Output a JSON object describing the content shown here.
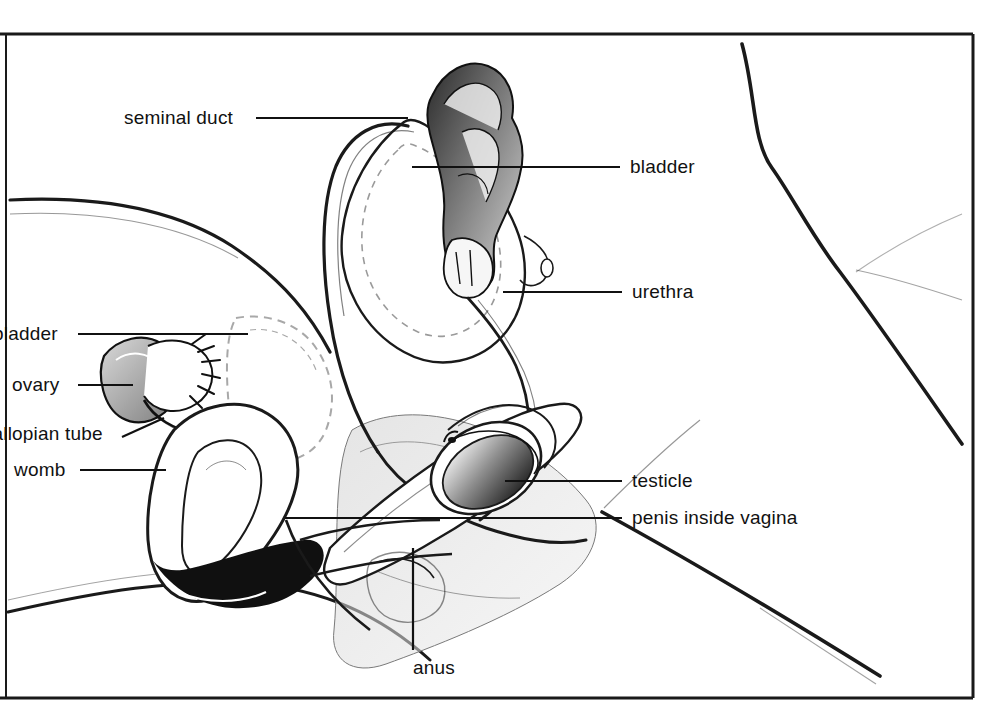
{
  "figure": {
    "style": "line drawing, black ink on white, labelled with leader lines",
    "frame_color": "#1a1a1a",
    "ink_color": "#111111",
    "background_color": "#ffffff"
  },
  "labels": [
    {
      "id": "seminal-duct",
      "text": "seminal duct",
      "side": "left",
      "x": 124,
      "y": 118,
      "clipped": false
    },
    {
      "id": "bladder-male",
      "text": "bladder",
      "side": "right",
      "x": 630,
      "y": 167,
      "clipped": false
    },
    {
      "id": "urethra",
      "text": "urethra",
      "side": "right",
      "x": 632,
      "y": 292,
      "clipped": false
    },
    {
      "id": "bladder-female",
      "text": "bladder",
      "side": "left",
      "x": 0,
      "y": 334,
      "clipped": true
    },
    {
      "id": "ovary",
      "text": "ovary",
      "side": "left",
      "x": 12,
      "y": 385,
      "clipped": false
    },
    {
      "id": "fallopian-tube",
      "text": "fallopian tube",
      "side": "left",
      "x": 0,
      "y": 434,
      "clipped": true
    },
    {
      "id": "womb",
      "text": "womb",
      "side": "left",
      "x": 14,
      "y": 470,
      "clipped": false
    },
    {
      "id": "testicle",
      "text": "testicle",
      "side": "right",
      "x": 632,
      "y": 481,
      "clipped": false
    },
    {
      "id": "penis-inside-vagina",
      "text": "penis inside vagina",
      "side": "right",
      "x": 632,
      "y": 518,
      "clipped": false
    },
    {
      "id": "anus",
      "text": "anus",
      "side": "bottom",
      "x": 413,
      "y": 668,
      "clipped": false
    }
  ],
  "leader_lines": [
    {
      "id": "leader-seminal-duct",
      "x1": 256,
      "y1": 118,
      "x2": 408,
      "y2": 118
    },
    {
      "id": "leader-bladder-male",
      "x1": 412,
      "y1": 167,
      "x2": 620,
      "y2": 167
    },
    {
      "id": "leader-urethra",
      "x1": 503,
      "y1": 292,
      "x2": 622,
      "y2": 292
    },
    {
      "id": "leader-bladder-female",
      "x1": 78,
      "y1": 334,
      "x2": 248,
      "y2": 334
    },
    {
      "id": "leader-ovary",
      "x1": 78,
      "y1": 385,
      "x2": 133,
      "y2": 385
    },
    {
      "id": "leader-fallopian-tube",
      "x1": 122,
      "y1": 437,
      "x2": 162,
      "y2": 420
    },
    {
      "id": "leader-womb",
      "x1": 80,
      "y1": 470,
      "x2": 166,
      "y2": 470
    },
    {
      "id": "leader-testicle",
      "x1": 505,
      "y1": 481,
      "x2": 622,
      "y2": 481
    },
    {
      "id": "leader-penis-inside-vagina",
      "x1": 285,
      "y1": 518,
      "x2": 622,
      "y2": 518
    },
    {
      "id": "leader-anus",
      "x1": 413,
      "y1": 548,
      "x2": 413,
      "y2": 650
    }
  ],
  "frame": {
    "left": 6,
    "top": 33,
    "right": 973,
    "bottom": 698
  },
  "organs": [
    "male bladder",
    "seminal duct",
    "urethra",
    "testicle",
    "penis",
    "female bladder",
    "ovary",
    "fallopian tube",
    "womb",
    "vagina",
    "anus"
  ]
}
